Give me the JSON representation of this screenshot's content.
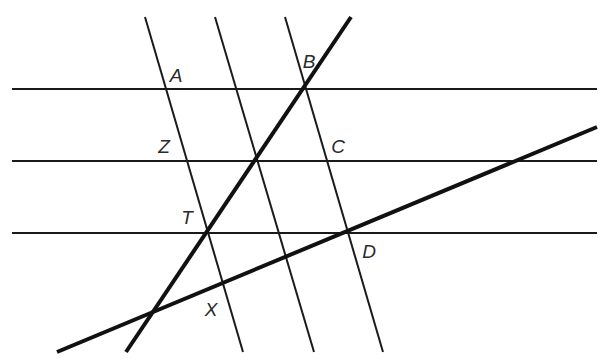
{
  "diagram": {
    "type": "geometry-parallel-lines-transversals",
    "colors": {
      "line": "#1a1a1a",
      "background": "#ffffff",
      "label": "#2a2a2a"
    },
    "horizontal_lines": [
      {
        "id": "h1",
        "x1": 12,
        "y1": 89,
        "x2": 597,
        "y2": 89
      },
      {
        "id": "h2",
        "x1": 12,
        "y1": 161,
        "x2": 597,
        "y2": 161
      },
      {
        "id": "h3",
        "x1": 12,
        "y1": 233,
        "x2": 597,
        "y2": 233
      }
    ],
    "parallel_transversals": [
      {
        "id": "t1",
        "x1": 145,
        "y1": 17,
        "x2": 243,
        "y2": 352
      },
      {
        "id": "t2",
        "x1": 215,
        "y1": 17,
        "x2": 314,
        "y2": 352
      },
      {
        "id": "t3",
        "x1": 285,
        "y1": 17,
        "x2": 383,
        "y2": 352
      }
    ],
    "thick_lines": [
      {
        "id": "BT",
        "x1": 351,
        "y1": 17,
        "x2": 126,
        "y2": 352
      },
      {
        "id": "DX",
        "x1": 57,
        "y1": 352,
        "x2": 597,
        "y2": 127
      }
    ],
    "points": [
      {
        "label": "A",
        "x": 176,
        "y": 75
      },
      {
        "label": "B",
        "x": 309,
        "y": 61
      },
      {
        "label": "Z",
        "x": 164,
        "y": 146
      },
      {
        "label": "C",
        "x": 338,
        "y": 146
      },
      {
        "label": "T",
        "x": 187,
        "y": 217
      },
      {
        "label": "D",
        "x": 369,
        "y": 251
      },
      {
        "label": "X",
        "x": 211,
        "y": 309
      }
    ]
  }
}
